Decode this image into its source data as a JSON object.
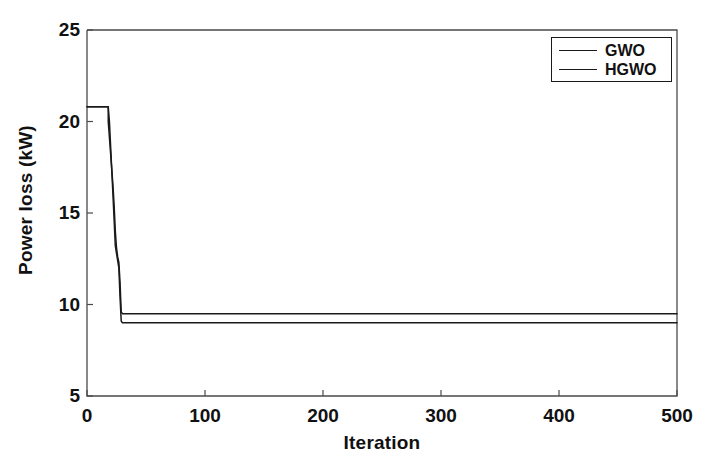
{
  "chart_data": {
    "type": "line",
    "title": "",
    "xlabel": "Iteration",
    "ylabel": "Power loss (kW)",
    "xlim": [
      0,
      500
    ],
    "ylim": [
      5,
      25
    ],
    "xticks": [
      0,
      100,
      200,
      300,
      400,
      500
    ],
    "yticks": [
      5,
      10,
      15,
      20,
      25
    ],
    "xtick_labels": [
      "0",
      "100",
      "200",
      "300",
      "400",
      "500"
    ],
    "ytick_labels": [
      "5",
      "10",
      "15",
      "20",
      "25"
    ],
    "grid": false,
    "legend_position": "top-right",
    "line_color": "#1a1a1a",
    "background_color": "#ffffff",
    "series": [
      {
        "name": "GWO",
        "color": "#1a1a1a",
        "x": [
          0,
          18,
          18,
          22,
          23,
          24,
          25,
          26,
          27,
          28,
          29,
          30,
          32,
          500
        ],
        "values": [
          20.8,
          20.8,
          20.0,
          16.5,
          15.4,
          14.0,
          13.1,
          12.6,
          12.3,
          11.2,
          9.6,
          9.5,
          9.5,
          9.5
        ]
      },
      {
        "name": "HGWO",
        "color": "#1a1a1a",
        "x": [
          0,
          18,
          19,
          22,
          23,
          24,
          25,
          26,
          27,
          28,
          29,
          30,
          33,
          500
        ],
        "values": [
          20.8,
          20.8,
          20.0,
          16.0,
          14.6,
          13.2,
          12.8,
          12.4,
          12.0,
          10.4,
          9.1,
          9.0,
          9.0,
          9.0
        ]
      }
    ]
  },
  "legend": {
    "items": [
      {
        "label": "GWO"
      },
      {
        "label": "HGWO"
      }
    ]
  }
}
